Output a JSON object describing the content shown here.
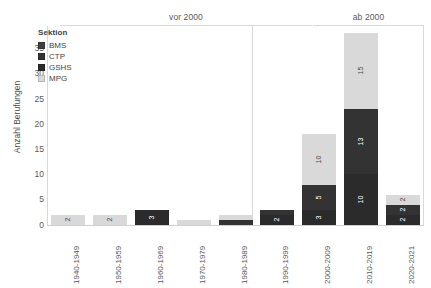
{
  "legend": {
    "title": "Sektion",
    "items": [
      {
        "label": "BMS",
        "color": "#3f3f3f"
      },
      {
        "label": "CTP",
        "color": "#333333"
      },
      {
        "label": "GSHS",
        "color": "#2b2b2b"
      },
      {
        "label": "MPG",
        "color": "#d9d9d9"
      }
    ]
  },
  "axes": {
    "y_title": "Anzahl Berufungen",
    "y_ticks": [
      "0",
      "5",
      "10",
      "15",
      "20",
      "25",
      "30",
      "35"
    ]
  },
  "panels": [
    {
      "label": "vor 2000"
    },
    {
      "label": "ab 2000"
    }
  ],
  "chart_data": {
    "type": "bar",
    "title": "",
    "xlabel": "",
    "ylabel": "Anzahl Berufungen",
    "ylim": [
      0,
      37
    ],
    "grid": false,
    "stacked": true,
    "legend_position": "inside-top-left",
    "panels": [
      "vor 2000",
      "ab 2000"
    ],
    "panel_split_after_category": "1990-1999",
    "categories": [
      "1940-1949",
      "1950-1959",
      "1960-1969",
      "1970-1979",
      "1980-1989",
      "1990-1999",
      "2000-2009",
      "2010-2019",
      "2020-2021"
    ],
    "series": [
      {
        "name": "BMS",
        "color": "#3f3f3f",
        "values": [
          0,
          0,
          0,
          0,
          0,
          0,
          0,
          0,
          0
        ]
      },
      {
        "name": "GSHS",
        "color": "#2b2b2b",
        "values": [
          0,
          0,
          3,
          0,
          0,
          2,
          3,
          10,
          2
        ]
      },
      {
        "name": "CTP",
        "color": "#333333",
        "values": [
          0,
          0,
          0,
          0,
          1,
          1,
          5,
          13,
          2
        ]
      },
      {
        "name": "MPG",
        "color": "#d9d9d9",
        "values": [
          2,
          2,
          0,
          1,
          1,
          0,
          10,
          15,
          2
        ]
      }
    ],
    "totals": [
      2,
      2,
      3,
      1,
      2,
      3,
      18,
      38,
      6
    ],
    "bar_labels": {
      "1940-1949": [
        "2"
      ],
      "1950-1959": [
        "2"
      ],
      "1960-1969": [
        "3"
      ],
      "1970-1979": [
        "1"
      ],
      "1980-1989": [
        "1",
        "1"
      ],
      "1990-1999": [
        "1",
        "2"
      ],
      "2000-2009": [
        "10",
        "5",
        "3"
      ],
      "2010-2019": [
        "15",
        "13",
        "10"
      ],
      "2020-2021": [
        "2",
        "2",
        "2"
      ]
    }
  }
}
